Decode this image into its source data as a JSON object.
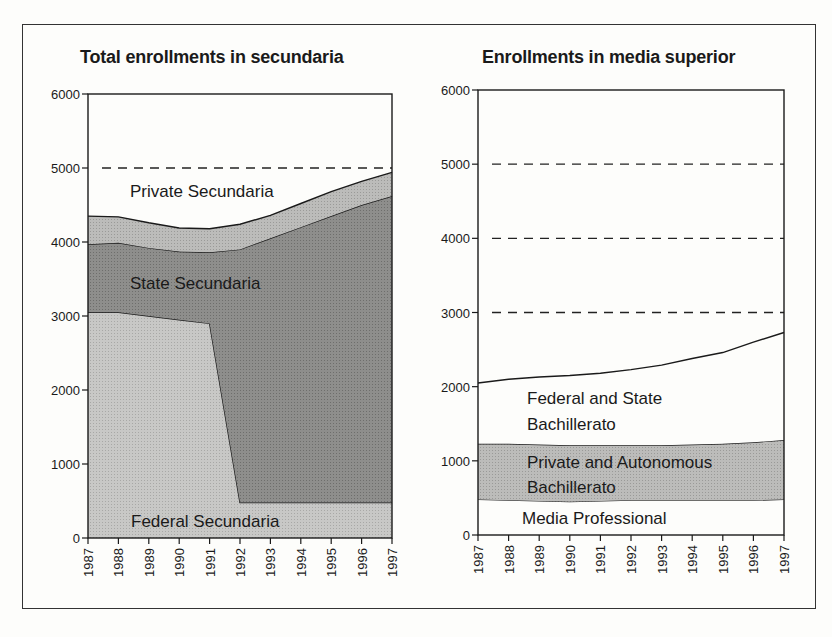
{
  "figure": {
    "left_title": "Total enrollments in secundaria",
    "right_title": "Enrollments in media superior"
  },
  "colors": {
    "federal_secundaria": "#c4c4c4",
    "state_secundaria": "#8c8c8c",
    "private_secundaria": "#bdbdbd",
    "private_autonomous_bachillerato": "#b4b4b4",
    "white_area": "#fdfdfb",
    "line": "#1a1a1a"
  },
  "chart_data": [
    {
      "type": "area",
      "stacked": true,
      "title": "Total enrollments in secundaria",
      "xlabel": "",
      "ylabel": "",
      "x": [
        1987,
        1988,
        1989,
        1990,
        1991,
        1992,
        1993,
        1994,
        1995,
        1996,
        1997
      ],
      "ylim": [
        0,
        6000
      ],
      "yticks": [
        0,
        1000,
        2000,
        3000,
        4000,
        5000,
        6000
      ],
      "reference_lines": [
        5000
      ],
      "grid": false,
      "legend": "inline area labels",
      "series": [
        {
          "name": "Federal Secundaria",
          "values": [
            3050,
            3050,
            3000,
            2950,
            2900,
            480,
            480,
            480,
            480,
            480,
            480
          ]
        },
        {
          "name": "State Secundaria",
          "values": [
            920,
            940,
            920,
            920,
            960,
            3420,
            3570,
            3720,
            3870,
            4020,
            4140
          ]
        },
        {
          "name": "Private Secundaria",
          "values": [
            380,
            350,
            340,
            320,
            320,
            340,
            310,
            320,
            330,
            320,
            320
          ]
        }
      ],
      "cumulative_tops": {
        "Federal Secundaria": [
          3050,
          3050,
          3000,
          2950,
          2900,
          480,
          480,
          480,
          480,
          480,
          480
        ],
        "State Secundaria": [
          3970,
          3990,
          3920,
          3870,
          3860,
          3900,
          4050,
          4200,
          4350,
          4500,
          4620
        ],
        "Private Secundaria": [
          4350,
          4340,
          4260,
          4190,
          4180,
          4240,
          4360,
          4520,
          4680,
          4820,
          4940
        ]
      }
    },
    {
      "type": "area",
      "stacked": true,
      "title": "Enrollments in media superior",
      "xlabel": "",
      "ylabel": "",
      "x": [
        1987,
        1988,
        1989,
        1990,
        1991,
        1992,
        1993,
        1994,
        1995,
        1996,
        1997
      ],
      "ylim": [
        0,
        6000
      ],
      "yticks": [
        0,
        1000,
        2000,
        3000,
        4000,
        5000,
        6000
      ],
      "reference_lines": [
        3000,
        4000,
        5000
      ],
      "grid": false,
      "legend": "inline area labels",
      "series": [
        {
          "name": "Media Professional",
          "values": [
            480,
            470,
            460,
            450,
            460,
            470,
            470,
            470,
            470,
            470,
            480
          ]
        },
        {
          "name": "Private and Autonomous Bachillerato",
          "values": [
            750,
            760,
            760,
            760,
            750,
            740,
            740,
            750,
            760,
            780,
            800
          ]
        },
        {
          "name": "Federal and State Bachillerato",
          "values": [
            820,
            870,
            910,
            940,
            970,
            1020,
            1080,
            1160,
            1230,
            1350,
            1450
          ]
        }
      ],
      "cumulative_tops": {
        "Media Professional": [
          480,
          470,
          460,
          450,
          460,
          470,
          470,
          470,
          470,
          470,
          480
        ],
        "Private and Autonomous Bachillerato": [
          1230,
          1230,
          1220,
          1210,
          1210,
          1210,
          1210,
          1220,
          1230,
          1250,
          1280
        ],
        "Federal and State Bachillerato": [
          2050,
          2100,
          2130,
          2150,
          2180,
          2230,
          2290,
          2380,
          2460,
          2600,
          2730
        ]
      }
    }
  ],
  "labels": {
    "left": {
      "private": "Private Secundaria",
      "state": "State Secundaria",
      "federal": "Federal Secundaria"
    },
    "right": {
      "fed_state_line1": "Federal and State",
      "fed_state_line2": "Bachillerato",
      "private_line1": "Private and Autonomous",
      "private_line2": "Bachillerato",
      "media_prof": "Media Professional"
    }
  }
}
